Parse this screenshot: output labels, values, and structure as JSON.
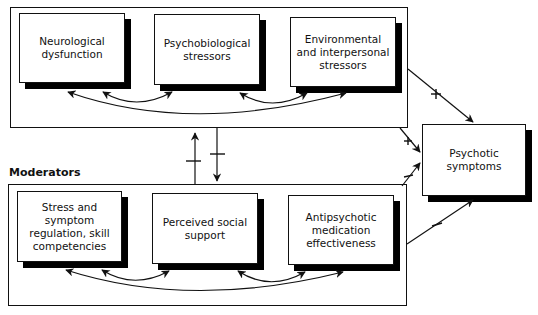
{
  "diagram": {
    "top_group": {
      "boxes": [
        {
          "id": "neuro",
          "text": "Neurological dysfunction"
        },
        {
          "id": "psychobio",
          "text": "Psychobiological stressors"
        },
        {
          "id": "env",
          "text": "Environmental and interpersonal stressors"
        }
      ]
    },
    "bottom_group": {
      "label": "Moderators",
      "boxes": [
        {
          "id": "stress",
          "text": "Stress and symptom regulation, skill competencies"
        },
        {
          "id": "social",
          "text": "Perceived social support"
        },
        {
          "id": "med",
          "text": "Antipsychotic medication effectiveness"
        }
      ]
    },
    "outcome": {
      "id": "psychotic",
      "text": "Psychotic symptoms"
    },
    "edges": [
      {
        "from": "env",
        "to": "psychotic",
        "sign": "+"
      },
      {
        "from": "top_group",
        "to": "psychotic",
        "sign": "+"
      },
      {
        "from": "bottom_group",
        "to": "psychotic",
        "sign": "−"
      },
      {
        "from": "med",
        "to": "psychotic",
        "sign": "−"
      },
      {
        "from": "bottom_group",
        "to": "top_group",
        "sign": "−"
      },
      {
        "from": "top_group",
        "to": "bottom_group",
        "sign": "−"
      }
    ]
  }
}
